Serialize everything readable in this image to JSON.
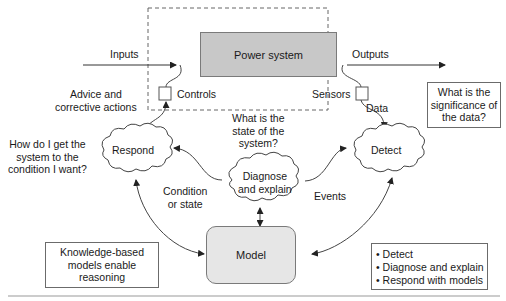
{
  "diagram": {
    "power_system": "Power system",
    "model": "Model",
    "inputs": "Inputs",
    "outputs": "Outputs",
    "controls": "Controls",
    "sensors": "Sensors",
    "data": "Data",
    "advice": [
      "Advice and",
      "corrective actions"
    ],
    "significance_question": [
      "What is the",
      "significance of",
      "the data?"
    ],
    "state_question": [
      "What is the",
      "state of the",
      "system?"
    ],
    "respond_question": [
      "How do I get the",
      "system to the",
      "condition I want?"
    ],
    "clouds": {
      "respond": "Respond",
      "diagnose": [
        "Diagnose",
        "and explain"
      ],
      "detect": "Detect"
    },
    "condition": [
      "Condition",
      "or state"
    ],
    "events": "Events",
    "knowledge_box": [
      "Knowledge-based",
      "models enable",
      "reasoning"
    ],
    "bullets": [
      "Detect",
      "Diagnose and explain",
      "Respond with models"
    ],
    "colors": {
      "power_fill": "#c8c8c8",
      "model_fill": "#e6e6e6",
      "line": "#444444"
    }
  }
}
